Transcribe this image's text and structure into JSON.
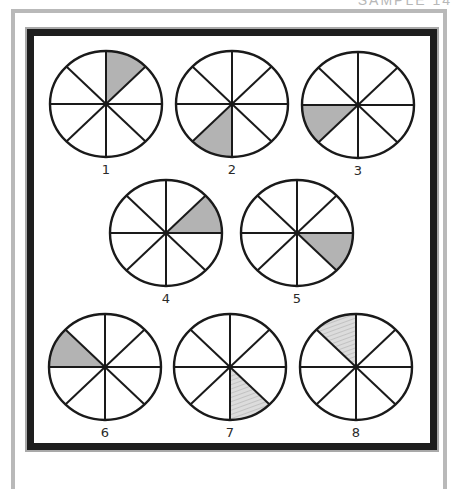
{
  "header": {
    "text": "SAMPLE  14"
  },
  "colors": {
    "outline": "#1a1a1a",
    "shade_solid": "#b3b3b3",
    "shade_hatched": "#d8d8d8",
    "hatch_lines": "#9e9e9e"
  },
  "diagram": {
    "sectors_per_circle": 8,
    "circles": [
      {
        "label": "1",
        "shaded_sector": "top-right (12 to 1:30)",
        "fill_style": "solid"
      },
      {
        "label": "2",
        "shaded_sector": "bottom-left (6 to 7:30)",
        "fill_style": "solid"
      },
      {
        "label": "3",
        "shaded_sector": "left-lower (7:30 to 9)",
        "fill_style": "solid"
      },
      {
        "label": "4",
        "shaded_sector": "right-upper (1:30 to 3)",
        "fill_style": "solid"
      },
      {
        "label": "5",
        "shaded_sector": "right-lower (3 to 4:30)",
        "fill_style": "solid"
      },
      {
        "label": "6",
        "shaded_sector": "left-upper (9 to 10:30)",
        "fill_style": "solid"
      },
      {
        "label": "7",
        "shaded_sector": "bottom-right (4:30 to 6)",
        "fill_style": "hatched"
      },
      {
        "label": "8",
        "shaded_sector": "top-left (10:30 to 12)",
        "fill_style": "hatched"
      }
    ]
  }
}
